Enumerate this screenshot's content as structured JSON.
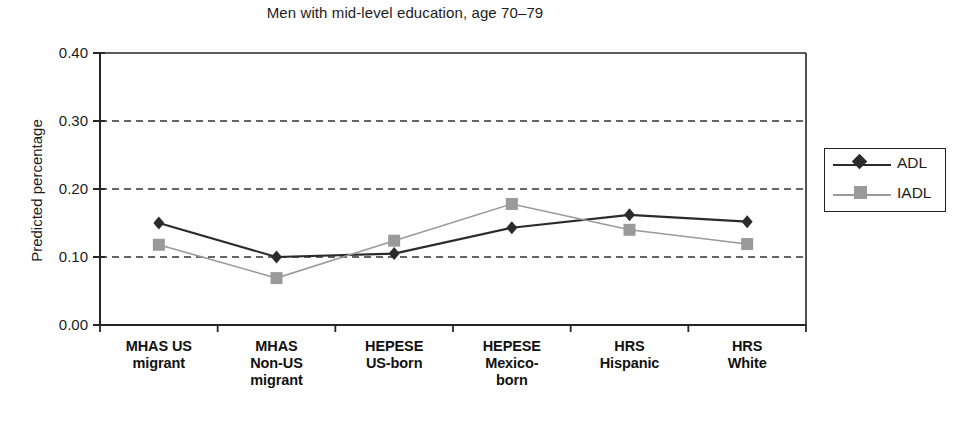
{
  "chart_data": {
    "type": "line",
    "title": "Men with mid-level education, age 70–79",
    "xlabel": "",
    "ylabel": "Predicted percentage",
    "categories": [
      "MHAS US\nmigrant",
      "MHAS\nNon-US\nmigrant",
      "HEPESE\nUS-born",
      "HEPESE\nMexico-\nborn",
      "HRS\nHispanic",
      "HRS\nWhite"
    ],
    "category_lines": [
      [
        "MHAS US",
        "migrant"
      ],
      [
        "MHAS",
        "Non-US",
        "migrant"
      ],
      [
        "HEPESE",
        "US-born"
      ],
      [
        "HEPESE",
        "Mexico-",
        "born"
      ],
      [
        "HRS",
        "Hispanic"
      ],
      [
        "HRS",
        "White"
      ]
    ],
    "series": [
      {
        "name": "ADL",
        "marker": "diamond",
        "color": "#2b2b2b",
        "values": [
          0.15,
          0.1,
          0.105,
          0.143,
          0.162,
          0.152
        ]
      },
      {
        "name": "IADL",
        "marker": "square",
        "color": "#9a9a9a",
        "values": [
          0.118,
          0.069,
          0.124,
          0.178,
          0.14,
          0.119
        ]
      }
    ],
    "ylim": [
      0.0,
      0.4
    ],
    "yticks": [
      0.0,
      0.1,
      0.2,
      0.3,
      0.4
    ],
    "ytick_labels": [
      "0.00",
      "0.10",
      "0.20",
      "0.30",
      "0.40"
    ],
    "grid": "horizontal-dashed",
    "legend_position": "right",
    "legend_entries": [
      "ADL",
      "IADL"
    ]
  },
  "colors": {
    "adl": "#2b2b2b",
    "iadl": "#9a9a9a",
    "axis": "#262626",
    "grid": "#333333",
    "background": "#ffffff"
  }
}
